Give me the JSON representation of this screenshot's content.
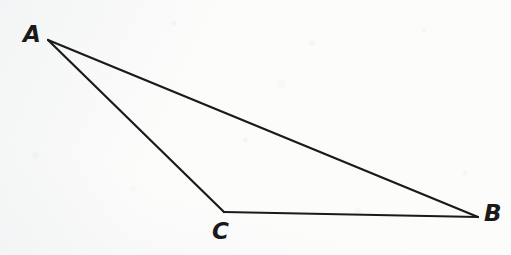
{
  "figure": {
    "type": "geometric-diagram",
    "shape": "triangle",
    "background_color": "#fcfcfb",
    "stroke_color": "#1a1a1a",
    "stroke_width": 2.2,
    "canvas": {
      "width": 511,
      "height": 255
    }
  },
  "vertices": [
    {
      "id": "A",
      "label": "A",
      "x": 48,
      "y": 40,
      "label_x": 23,
      "label_y": 23
    },
    {
      "id": "B",
      "label": "B",
      "x": 478,
      "y": 217,
      "label_x": 484,
      "label_y": 202
    },
    {
      "id": "C",
      "label": "C",
      "x": 224,
      "y": 212,
      "label_x": 212,
      "label_y": 220
    }
  ],
  "edges": [
    {
      "id": "AB",
      "from": "A",
      "to": "B",
      "x1": 48,
      "y1": 40,
      "x2": 478,
      "y2": 217
    },
    {
      "id": "AC",
      "from": "A",
      "to": "C",
      "x1": 48,
      "y1": 40,
      "x2": 224,
      "y2": 212
    },
    {
      "id": "CB",
      "from": "C",
      "to": "B",
      "x1": 224,
      "y1": 212,
      "x2": 478,
      "y2": 217
    }
  ]
}
